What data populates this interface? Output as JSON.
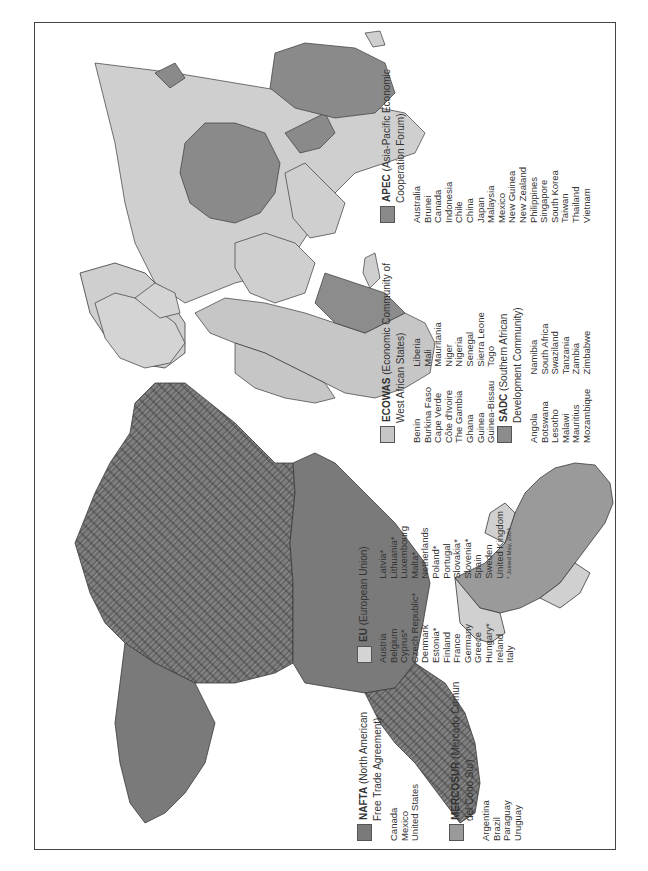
{
  "map": {
    "title": "World Regional Trade Blocs",
    "colors": {
      "nafta": "#7a7a7a",
      "mercosur": "#9a9a9a",
      "eu": "#d4d4d4",
      "ecowas": "#c6c6c6",
      "sadc": "#8c8c8c",
      "apec": "#8a8a8a",
      "land_other": "#cfcfcf",
      "border": "#3a3a3a",
      "water": "#ffffff"
    }
  },
  "legend": {
    "nafta": {
      "abbr": "NAFTA",
      "name_line1": "(North American",
      "name_line2": "Free Trade Agreement)",
      "members": [
        "Canada",
        "Mexico",
        "United States"
      ]
    },
    "mercosur": {
      "abbr": "MERCOSUR",
      "name_line1": "(Mercado Comun",
      "name_line2": "del Cono Sur)",
      "members": [
        "Argentina",
        "Brazil",
        "Paraguay",
        "Uruguay"
      ]
    },
    "eu": {
      "abbr": "EU",
      "name_line1": "(European Union)",
      "members_col1": [
        "Austria",
        "Belgium",
        "Cyprus*",
        "Czech Republic*",
        "Denmark",
        "Estonia*",
        "Finland",
        "France",
        "Germany",
        "Greece",
        "Hungary*",
        "Ireland",
        "Italy"
      ],
      "members_col2": [
        "Latvia*",
        "Lithuania*",
        "Luxembourg",
        "Malta*",
        "Netherlands",
        "Poland*",
        "Portugal",
        "Slovakia*",
        "Slovenia*",
        "Spain",
        "Sweden",
        "United Kingdom"
      ],
      "footnote": "* Joined May, 2004"
    },
    "ecowas": {
      "abbr": "ECOWAS",
      "name_line1": "(Economic Community of",
      "name_line2": "West African States)",
      "members_col1": [
        "Benin",
        "Burkina Faso",
        "Cape Verde",
        "Côte d'Ivoire",
        "The Gambia",
        "Ghana",
        "Guinea",
        "Guinea-Bissau"
      ],
      "members_col2": [
        "Liberia",
        "Mali",
        "Mauritania",
        "Niger",
        "Nigeria",
        "Senegal",
        "Sierra Leone",
        "Togo"
      ]
    },
    "sadc": {
      "abbr": "SADC",
      "name_line1": "(Southern African",
      "name_line2": "Development Community)",
      "members_col1": [
        "Angola",
        "Botswana",
        "Lesotho",
        "Malawi",
        "Mauritius",
        "Mozambique"
      ],
      "members_col2": [
        "Namibia",
        "South Africa",
        "Swaziland",
        "Tanzania",
        "Zambia",
        "Zimbabwe"
      ]
    },
    "apec": {
      "abbr": "APEC",
      "name_line1": "(Asia-Pacific Economic",
      "name_line2": "Cooperation Forum)",
      "members": [
        "Australia",
        "Brunei",
        "Canada",
        "Indonesia",
        "Chile",
        "China",
        "Japan",
        "Malaysia",
        "Mexico",
        "New Guinea",
        "New Zealand",
        "Philippines",
        "Singapore",
        "South Korea",
        "Taiwan",
        "Thailand",
        "Vietnam"
      ]
    }
  }
}
